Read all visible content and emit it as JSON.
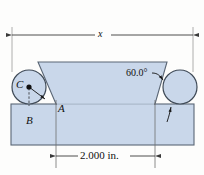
{
  "figure": {
    "background_color": "#fdfdfc",
    "part_fill_color": "#c9d7ea",
    "part_edge_color": "#5a6675",
    "line_color": "#3a3a3a",
    "text_color": "#111111"
  },
  "dimensions": {
    "overall": {
      "label": "x",
      "name": "overall-width-dimension",
      "arrow_left_x": 12,
      "arrow_right_x": 193,
      "line_y": 35
    },
    "lower": {
      "label": "2.000 in.",
      "name": "base-width-dimension",
      "arrow_left_x": 56,
      "arrow_right_x": 155,
      "line_y": 156
    }
  },
  "angle_callout": {
    "label": "60.0°",
    "name": "dovetail-angle-callout"
  },
  "points": [
    {
      "id": "A",
      "label": "A",
      "name": "point-label-a",
      "x": 58,
      "y": 103
    },
    {
      "id": "B",
      "label": "B",
      "name": "point-label-b",
      "x": 26,
      "y": 115
    },
    {
      "id": "C",
      "label": "C",
      "name": "point-label-c",
      "x": 16,
      "y": 79
    }
  ],
  "pins": [
    {
      "id": "left-pin",
      "name": "gauge-pin-left",
      "cx": 29,
      "cy": 87,
      "r": 17
    },
    {
      "id": "right-pin",
      "name": "gauge-pin-right",
      "cx": 180,
      "cy": 87,
      "r": 17
    }
  ],
  "part": {
    "name": "dovetail-part-body",
    "dovetail_top_y": 62,
    "dovetail_bottom_y": 104,
    "base_top_y": 104,
    "base_bottom_y": 145,
    "base_left_x": 11,
    "base_right_x": 194
  }
}
